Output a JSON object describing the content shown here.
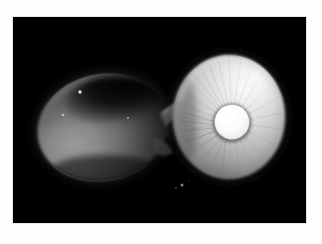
{
  "document": {
    "type": "scientific-figure-plate",
    "background_color": "#fefefe",
    "page_width": 322,
    "page_height": 244
  },
  "figure": {
    "frame": {
      "x": 13,
      "y": 17,
      "width": 293,
      "height": 206,
      "background_color": "#000000",
      "border_color": "#c9c9c9"
    },
    "photograph": {
      "subject": "two-mushroom-specimens",
      "description": "Black-background macro photograph of two mushroom basidiocarps placed side by side",
      "lighting": "single directional light from upper right",
      "color_mode": "grayscale",
      "specimens": [
        {
          "id": "specimen-left",
          "view": "pileus-surface-view",
          "label": "dark cap, upper surface",
          "tone": "dark grey to near black",
          "center_x": 103,
          "center_y": 127,
          "radius_x": 66,
          "radius_y": 53,
          "rotation_deg": -12,
          "fill_highlight": "#9a9a9a",
          "fill_midtone": "#555555",
          "fill_shadow": "#101010"
        },
        {
          "id": "specimen-right",
          "view": "hymenium-gill-view",
          "label": "pale underside with central stipe",
          "tone": "light grey to white",
          "center_x": 229,
          "center_y": 117,
          "radius_x": 56,
          "radius_y": 62,
          "rotation_deg": 4,
          "fill_highlight": "#f4f4f4",
          "fill_midtone": "#bdbdbd",
          "fill_shadow": "#4a4a4a"
        }
      ],
      "stipe_disc": {
        "id": "central-stipe-cross-section",
        "center_x": 232,
        "center_y": 122,
        "radius": 18,
        "color": "#fdfdfd",
        "rim_color": "#8f8f8f"
      },
      "connecting_stem": {
        "id": "lateral-stipe",
        "from_x": 163,
        "from_y": 104,
        "to_x": 188,
        "to_y": 88,
        "color": "#7c7c7c"
      },
      "specks": [
        {
          "x": 80,
          "y": 92,
          "r": 1.6,
          "color": "#e8e8e8"
        },
        {
          "x": 63,
          "y": 115,
          "r": 1.3,
          "color": "#d8d8d8"
        },
        {
          "x": 128,
          "y": 118,
          "r": 1.1,
          "color": "#c8c8c8"
        },
        {
          "x": 182,
          "y": 185,
          "r": 1.4,
          "color": "#9a9a9a"
        },
        {
          "x": 176,
          "y": 188,
          "r": 0.9,
          "color": "#707070"
        }
      ]
    }
  },
  "caption": {
    "label": "Fig. 1.",
    "text": "Basidiocarps showing pileus and hymenium.",
    "full": "Fig. 1. Basidiocarps showing pileus and hymenium.",
    "color": "#fbfbfb",
    "alignment": "center",
    "visibility_note": "printed in very pale grey, nearly illegible"
  }
}
